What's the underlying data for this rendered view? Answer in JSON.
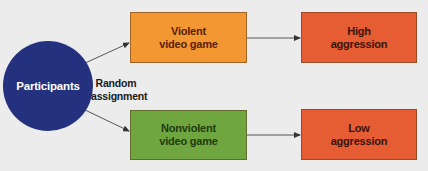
{
  "diagram": {
    "type": "flowchart",
    "source_node": {
      "label": "Participants",
      "shape": "circle",
      "color": "#24317f"
    },
    "edge_label": {
      "line1": "Random",
      "line2": "assignment"
    },
    "conditions": [
      {
        "line1": "Violent",
        "line2": "video game",
        "color": "#f29731"
      },
      {
        "line1": "Nonviolent",
        "line2": "video game",
        "color": "#6fa63f"
      }
    ],
    "outcomes": [
      {
        "line1": "High",
        "line2": "aggression",
        "color": "#e65c33"
      },
      {
        "line1": "Low",
        "line2": "aggression",
        "color": "#e65c33"
      }
    ],
    "edges": [
      {
        "from": "Participants",
        "to": "Violent video game"
      },
      {
        "from": "Participants",
        "to": "Nonviolent video game"
      },
      {
        "from": "Violent video game",
        "to": "High aggression"
      },
      {
        "from": "Nonviolent video game",
        "to": "Low aggression"
      }
    ],
    "background": "#ececec"
  }
}
